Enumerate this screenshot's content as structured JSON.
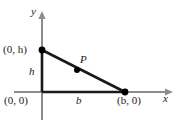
{
  "figure": {
    "type": "geometry-diagram",
    "colors": {
      "axis": "#8c8c8c",
      "triangle": "#1a1a1a",
      "point": "#000000",
      "text": "#1a1a1a",
      "background": "#ffffff"
    },
    "axes": {
      "x_label": "x",
      "y_label": "y",
      "origin_label": "(0, 0)"
    },
    "points": [
      {
        "name": "point-0h",
        "label": "(0, h)",
        "x": 0,
        "y": "h"
      },
      {
        "name": "point-b0",
        "label": "(b, 0)",
        "x": "b",
        "y": 0
      },
      {
        "name": "point-P",
        "label": "P"
      }
    ],
    "side_labels": [
      {
        "name": "height-label",
        "label": "h"
      },
      {
        "name": "base-label",
        "label": "b"
      }
    ]
  }
}
